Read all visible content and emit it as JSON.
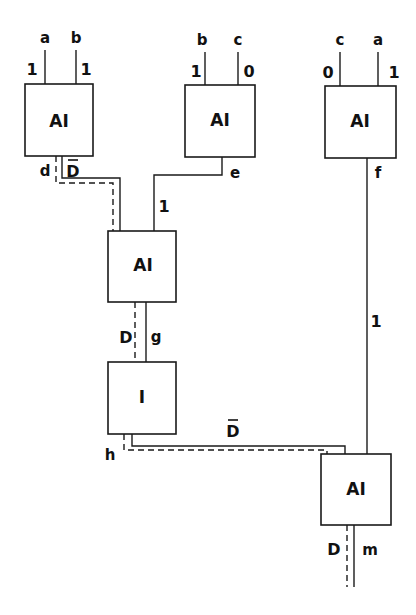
{
  "diagram": {
    "type": "logic-circuit-d-propagation",
    "gates": [
      {
        "id": "g1",
        "label": "AI",
        "inputs": [
          "a",
          "b"
        ],
        "input_values": [
          "1",
          "1"
        ],
        "output": "d"
      },
      {
        "id": "g2",
        "label": "AI",
        "inputs": [
          "b",
          "c"
        ],
        "input_values": [
          "1",
          "0"
        ],
        "output": "e"
      },
      {
        "id": "g3",
        "label": "AI",
        "inputs": [
          "c",
          "a"
        ],
        "input_values": [
          "0",
          "1"
        ],
        "output": "f"
      },
      {
        "id": "g4",
        "label": "AI",
        "inputs": [
          "d",
          "e"
        ],
        "output": "g"
      },
      {
        "id": "g5",
        "label": "I",
        "inputs": [
          "g"
        ],
        "output": "h"
      },
      {
        "id": "g6",
        "label": "AI",
        "inputs": [
          "h",
          "f"
        ],
        "output": "m"
      }
    ],
    "signals": {
      "a": "a",
      "b": "b",
      "c": "c",
      "d": "d",
      "e": "e",
      "f": "f",
      "g": "g",
      "h": "h",
      "m": "m"
    },
    "values": {
      "one": "1",
      "zero": "0",
      "d_bar": "D",
      "d": "D"
    },
    "annotations": {
      "g1_in_a_val": "1",
      "g1_in_b_val": "1",
      "g2_in_b_val": "1",
      "g2_in_c_val": "0",
      "g3_in_c_val": "0",
      "g3_in_a_val": "1",
      "d_value": "D",
      "e_value": "1",
      "f_value": "1",
      "g_value": "D",
      "h_value": "D",
      "m_value": "D"
    },
    "legend": {
      "solid": "signal wire",
      "dashed": "D-path propagation"
    }
  }
}
